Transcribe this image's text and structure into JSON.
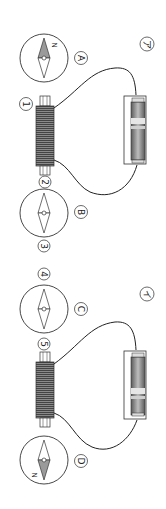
{
  "diagram": {
    "orientation": "rotated-90-clockwise",
    "circuits": [
      {
        "id": "circuit-a",
        "label": "ア",
        "compasses": [
          {
            "label": "A",
            "north_direction": "up",
            "north_label": "N"
          },
          {
            "label": "B",
            "north_direction": "none"
          }
        ],
        "coil_terminals": [
          "1",
          "2"
        ],
        "extra_markers": [
          "3"
        ]
      },
      {
        "id": "circuit-b",
        "label": "イ",
        "compasses": [
          {
            "label": "C",
            "north_direction": "none"
          },
          {
            "label": "D",
            "north_direction": "down",
            "north_label": "N"
          }
        ],
        "coil_terminals": [
          "4",
          "5"
        ]
      }
    ],
    "colors": {
      "line": "#333333",
      "needle_fill": "#9a9a9a",
      "coil_dark": "#555555",
      "battery_body": "#7a7a7a"
    }
  }
}
